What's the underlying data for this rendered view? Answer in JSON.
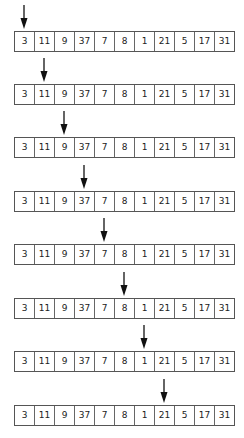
{
  "diagram": {
    "title": "",
    "array": [
      3,
      11,
      9,
      37,
      7,
      8,
      1,
      21,
      5,
      17,
      31
    ],
    "steps": [
      {
        "pointer_index": 0,
        "pointer_value": 3
      },
      {
        "pointer_index": 1,
        "pointer_value": 11
      },
      {
        "pointer_index": 2,
        "pointer_value": 9
      },
      {
        "pointer_index": 3,
        "pointer_value": 37
      },
      {
        "pointer_index": 4,
        "pointer_value": 7
      },
      {
        "pointer_index": 5,
        "pointer_value": 8
      },
      {
        "pointer_index": 6,
        "pointer_value": 1
      },
      {
        "pointer_index": 7,
        "pointer_value": 21
      }
    ],
    "colors": {
      "arrow": "#111111",
      "border": "#555555",
      "text": "#222222",
      "background": "#ffffff"
    }
  }
}
